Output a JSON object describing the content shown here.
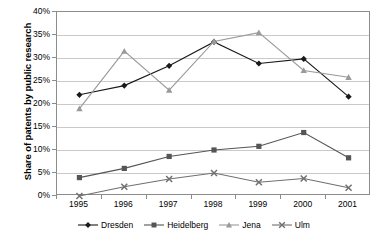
{
  "chart_data": {
    "type": "line",
    "title": "",
    "xlabel": "",
    "ylabel": "Share of patents by public research",
    "categories": [
      "1995",
      "1996",
      "1997",
      "1998",
      "1999",
      "2000",
      "2001"
    ],
    "ylim": [
      0,
      40
    ],
    "ytick_labels": [
      "0%",
      "5%",
      "10%",
      "15%",
      "20%",
      "25%",
      "30%",
      "35%",
      "40%"
    ],
    "ytick_values": [
      0,
      5,
      10,
      15,
      20,
      25,
      30,
      35,
      40
    ],
    "yaxis_unit": "%",
    "grid": "horizontal",
    "legend_position": "bottom",
    "series": [
      {
        "name": "Dresden",
        "marker": "diamond",
        "color": "#1a1a1a",
        "values": [
          22.0,
          24.0,
          28.3,
          33.5,
          28.8,
          29.8,
          21.6
        ]
      },
      {
        "name": "Heidelberg",
        "marker": "square",
        "color": "#555555",
        "values": [
          4.0,
          6.0,
          8.6,
          10.0,
          10.8,
          13.8,
          8.3
        ]
      },
      {
        "name": "Jena",
        "marker": "triangle",
        "color": "#9a9a9a",
        "values": [
          19.0,
          31.5,
          23.0,
          33.6,
          35.5,
          27.3,
          25.8
        ]
      },
      {
        "name": "Ulm",
        "marker": "cross",
        "color": "#707070",
        "values": [
          0.0,
          2.0,
          3.7,
          5.0,
          3.0,
          3.8,
          1.8
        ]
      }
    ]
  }
}
